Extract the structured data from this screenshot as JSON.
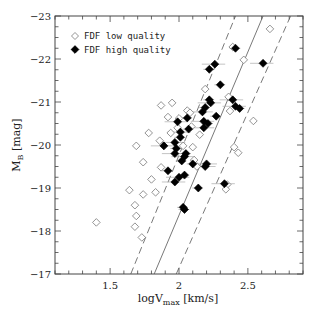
{
  "chart_data": {
    "type": "scatter",
    "title": "",
    "xlabel": "logV_max [km/s]",
    "ylabel": "M_B [mag]",
    "xlim": [
      1.1,
      2.9
    ],
    "ylim": [
      -17,
      -23
    ],
    "y_inverted": true,
    "grid": false,
    "x_ticks": [
      1.5,
      2,
      2.5
    ],
    "x_tick_labels": [
      "1.5",
      "2",
      "2.5"
    ],
    "y_ticks": [
      -23,
      -22,
      -21,
      -20,
      -19,
      -18,
      -17
    ],
    "y_tick_labels": [
      "-23",
      "-22",
      "-21",
      "-20",
      "-19",
      "-18",
      "-17"
    ],
    "legend": {
      "position": "upper left",
      "entries": [
        {
          "label": "FDF low quality",
          "marker": "open-diamond"
        },
        {
          "label": "FDF high quality",
          "marker": "filled-diamond"
        }
      ]
    },
    "lines": [
      {
        "name": "tully-fisher-fit",
        "style": "solid",
        "points": [
          [
            1.82,
            -17
          ],
          [
            2.61,
            -23
          ]
        ]
      },
      {
        "name": "upper-3sigma",
        "style": "dashed",
        "points": [
          [
            1.65,
            -17
          ],
          [
            2.41,
            -23
          ]
        ]
      },
      {
        "name": "lower-3sigma",
        "style": "dashed",
        "points": [
          [
            1.98,
            -17
          ],
          [
            2.81,
            -23
          ]
        ]
      }
    ],
    "series": [
      {
        "name": "FDF low quality",
        "marker": "open-diamond",
        "points": [
          [
            2.66,
            -22.7
          ],
          [
            2.39,
            -22.28
          ],
          [
            2.47,
            -21.98
          ],
          [
            2.19,
            -21.3
          ],
          [
            2.36,
            -21.12
          ],
          [
            1.95,
            -20.98
          ],
          [
            2.37,
            -20.79
          ],
          [
            2.0,
            -20.62
          ],
          [
            2.06,
            -20.8
          ],
          [
            1.87,
            -20.92
          ],
          [
            1.92,
            -20.65
          ],
          [
            2.08,
            -20.75
          ],
          [
            2.54,
            -20.56
          ],
          [
            1.99,
            -20.4
          ],
          [
            2.09,
            -20.43
          ],
          [
            1.78,
            -20.28
          ],
          [
            2.15,
            -20.24
          ],
          [
            1.94,
            -20.28
          ],
          [
            1.86,
            -20.1
          ],
          [
            1.89,
            -19.98
          ],
          [
            2.03,
            -19.98
          ],
          [
            1.69,
            -19.98
          ],
          [
            2.1,
            -19.95
          ],
          [
            1.74,
            -19.6
          ],
          [
            1.87,
            -19.48
          ],
          [
            1.8,
            -19.2
          ],
          [
            1.74,
            -18.85
          ],
          [
            1.64,
            -18.95
          ],
          [
            1.83,
            -18.9
          ],
          [
            1.68,
            -18.6
          ],
          [
            1.69,
            -18.35
          ],
          [
            1.68,
            -18.1
          ],
          [
            1.4,
            -18.2
          ],
          [
            1.73,
            -17.85
          ],
          [
            2.4,
            -19.95
          ],
          [
            2.43,
            -19.82
          ],
          [
            2.13,
            -19.5
          ],
          [
            2.11,
            -19.65
          ],
          [
            2.35,
            -19.08
          ],
          [
            2.34,
            -18.97
          ]
        ]
      },
      {
        "name": "FDF high quality",
        "marker": "filled-diamond",
        "xerr_shown": true,
        "points": [
          [
            2.41,
            -22.25
          ],
          [
            2.26,
            -21.88
          ],
          [
            2.22,
            -21.76
          ],
          [
            2.61,
            -21.9
          ],
          [
            2.3,
            -21.4
          ],
          [
            2.39,
            -21.05
          ],
          [
            2.44,
            -20.85
          ],
          [
            2.41,
            -20.9
          ],
          [
            2.22,
            -21.05
          ],
          [
            2.23,
            -20.98
          ],
          [
            2.19,
            -20.87
          ],
          [
            2.17,
            -20.77
          ],
          [
            2.27,
            -20.67
          ],
          [
            2.18,
            -20.55
          ],
          [
            2.21,
            -20.5
          ],
          [
            2.18,
            -20.4
          ],
          [
            2.06,
            -20.63
          ],
          [
            1.99,
            -20.54
          ],
          [
            2.07,
            -20.37
          ],
          [
            2.01,
            -20.3
          ],
          [
            2.01,
            -20.18
          ],
          [
            1.97,
            -20.06
          ],
          [
            1.98,
            -19.92
          ],
          [
            1.97,
            -19.8
          ],
          [
            2.05,
            -19.8
          ],
          [
            2.04,
            -19.73
          ],
          [
            2.02,
            -19.63
          ],
          [
            1.89,
            -19.98
          ],
          [
            2.1,
            -19.56
          ],
          [
            2.2,
            -19.56
          ],
          [
            1.92,
            -19.4
          ],
          [
            2.19,
            -19.5
          ],
          [
            2.04,
            -19.3
          ],
          [
            1.97,
            -19.14
          ],
          [
            2.14,
            -19.0
          ],
          [
            2.0,
            -19.25
          ],
          [
            2.03,
            -18.55
          ],
          [
            2.33,
            -19.1
          ],
          [
            2.04,
            -18.5
          ]
        ]
      }
    ]
  }
}
